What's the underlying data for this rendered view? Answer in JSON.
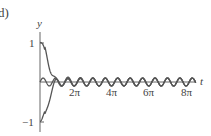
{
  "panel_label": "d)",
  "chart_data": {
    "type": "line",
    "title": "",
    "xlabel": "t",
    "ylabel": "y",
    "xlim": [
      0,
      8.6
    ],
    "ylim": [
      -1.1,
      1.2
    ],
    "x_units": "pi",
    "xticks": [
      {
        "value": 2,
        "label": "2π"
      },
      {
        "value": 4,
        "label": "4π"
      },
      {
        "value": 6,
        "label": "6π"
      },
      {
        "value": 8,
        "label": "8π"
      }
    ],
    "yticks": [
      {
        "value": 1,
        "label": "1"
      },
      {
        "value": -1,
        "label": "−1"
      }
    ],
    "grid": false,
    "legend": null,
    "series": [
      {
        "name": "solution y(0)=1",
        "initial": 1,
        "description": "starts at 1, decays rapidly to steady-state oscillation"
      },
      {
        "name": "solution y(0)=0",
        "initial": 0,
        "description": "small sinusoidal steady-state oscillation about 0"
      },
      {
        "name": "solution y(0)=-1",
        "initial": -1,
        "description": "starts at -1, rises to steady-state oscillation"
      }
    ],
    "steady_state": {
      "amplitude": 0.1,
      "angular_frequency": 3
    },
    "line_color": "#555555"
  }
}
